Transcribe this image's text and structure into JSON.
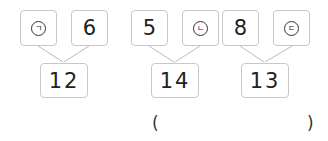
{
  "problems": [
    {
      "left": {
        "type": "symbol",
        "value": "ㄱ"
      },
      "right": {
        "type": "number",
        "value": "6"
      },
      "sum": "12"
    },
    {
      "left": {
        "type": "number",
        "value": "5"
      },
      "right": {
        "type": "symbol",
        "value": "ㄴ"
      },
      "sum": "14"
    },
    {
      "left": {
        "type": "number",
        "value": "8"
      },
      "right": {
        "type": "symbol",
        "value": "ㄷ"
      },
      "sum": "13"
    }
  ],
  "answer": {
    "open": "(",
    "close": ")",
    "value": ""
  },
  "colors": {
    "box_border": "#c8c8c8",
    "line": "#bbbbbb"
  }
}
